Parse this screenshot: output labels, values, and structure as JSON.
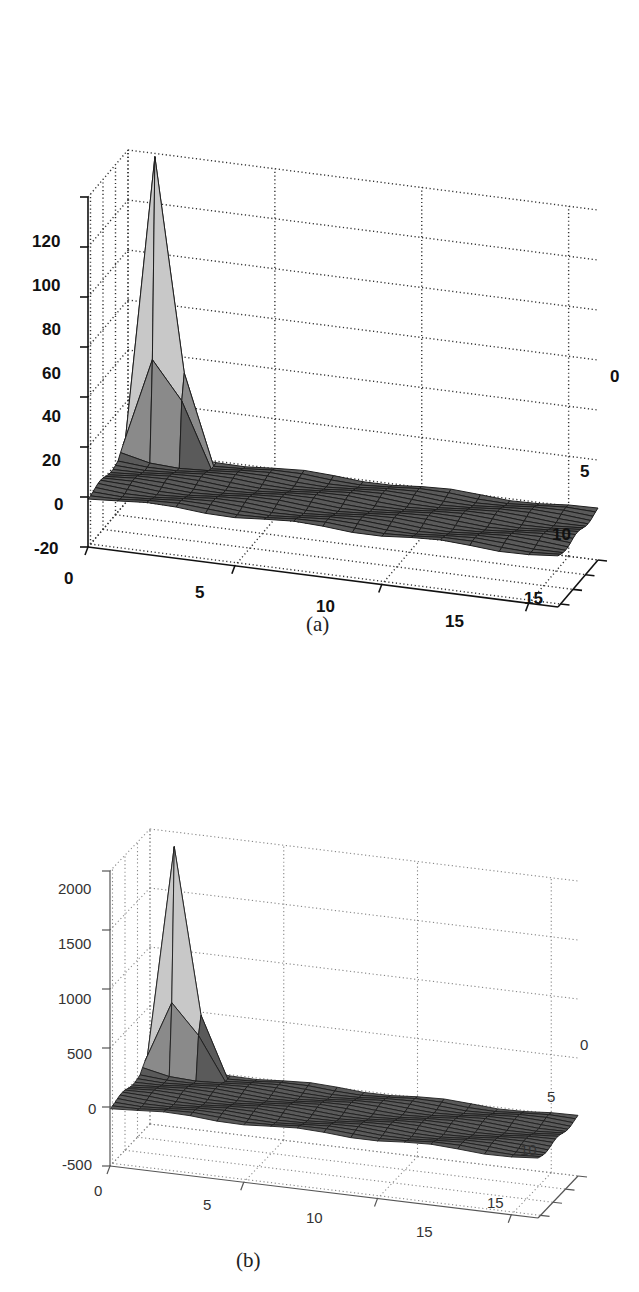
{
  "chart_data": [
    {
      "type": "surface3d",
      "panel": "(a)",
      "title": "",
      "xlabel": "",
      "ylabel": "",
      "zlabel": "",
      "x_ticks": [
        "0",
        "5",
        "10",
        "15"
      ],
      "y_ticks": [
        "0",
        "5",
        "10",
        "15"
      ],
      "z_ticks": [
        "120",
        "100",
        "80",
        "60",
        "40",
        "20",
        "0",
        "-20"
      ],
      "xlim": [
        0,
        16
      ],
      "ylim": [
        0,
        16
      ],
      "zlim": [
        -20,
        120
      ],
      "grid": true,
      "grid_size": [
        16,
        16
      ],
      "peak": {
        "x": 1,
        "y": 1,
        "z": 120
      },
      "secondary_bumps": [
        {
          "x": 1,
          "y": 2,
          "z": 40
        },
        {
          "x": 2,
          "y": 1,
          "z": 35
        },
        {
          "x": 2,
          "y": 2,
          "z": 25
        }
      ],
      "baseline_z": 0,
      "description": "Surface mostly flat near 0 with a single sharp spike (~120) near the origin corner"
    },
    {
      "type": "surface3d",
      "panel": "(b)",
      "title": "",
      "xlabel": "",
      "ylabel": "",
      "zlabel": "",
      "x_ticks": [
        "0",
        "5",
        "10",
        "15"
      ],
      "y_ticks": [
        "0",
        "5",
        "10",
        "15"
      ],
      "z_ticks": [
        "2000",
        "1500",
        "1000",
        "500",
        "0",
        "-500"
      ],
      "xlim": [
        0,
        16
      ],
      "ylim": [
        0,
        16
      ],
      "zlim": [
        -500,
        2000
      ],
      "grid": true,
      "grid_size": [
        16,
        16
      ],
      "peak": {
        "x": 1,
        "y": 1,
        "z": 1900
      },
      "secondary_bumps": [
        {
          "x": 1,
          "y": 2,
          "z": 600
        },
        {
          "x": 2,
          "y": 1,
          "z": 500
        },
        {
          "x": 2,
          "y": 2,
          "z": 350
        }
      ],
      "baseline_z": 0,
      "description": "Surface mostly flat near 0 with a single sharp spike (~1900) near the origin corner"
    }
  ],
  "figures": {
    "a": {
      "caption": "(a)",
      "z_ticks": [
        "120",
        "100",
        "80",
        "60",
        "40",
        "20",
        "0",
        "-20"
      ],
      "x_ticks": [
        "0",
        "5",
        "10",
        "15"
      ],
      "y_ticks": [
        "0",
        "5",
        "10",
        "15"
      ]
    },
    "b": {
      "caption": "(b)",
      "z_ticks": [
        "2000",
        "1500",
        "1000",
        "500",
        "0",
        "-500"
      ],
      "x_ticks": [
        "0",
        "5",
        "10",
        "15"
      ],
      "y_ticks": [
        "0",
        "5",
        "10",
        "15"
      ]
    }
  },
  "colors": {
    "surface": "#5a5a5a",
    "mesh": "#1e1e1e",
    "spike": "#c8c8c8",
    "grid": "#555555",
    "axis": "#222222"
  }
}
